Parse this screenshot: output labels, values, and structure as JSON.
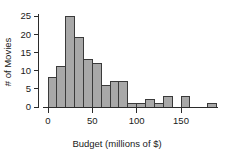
{
  "chart_data": {
    "type": "bar",
    "title": "",
    "subtitle": "",
    "xlabel": "Budget (millions of $)",
    "ylabel": "# of Movies",
    "xlim": [
      -5,
      195
    ],
    "ylim": [
      0,
      26
    ],
    "grid": false,
    "legend": null,
    "bin_width": 10,
    "bin_starts": [
      0,
      10,
      20,
      30,
      40,
      50,
      60,
      70,
      80,
      90,
      100,
      110,
      120,
      130,
      140,
      150,
      160,
      170,
      180
    ],
    "categories": [
      "0-10",
      "10-20",
      "20-30",
      "30-40",
      "40-50",
      "50-60",
      "60-70",
      "70-80",
      "80-90",
      "90-100",
      "100-110",
      "110-120",
      "120-130",
      "130-140",
      "140-150",
      "150-160",
      "160-170",
      "170-180",
      "180-190"
    ],
    "values": [
      8,
      11,
      25,
      19,
      13,
      12,
      6,
      7,
      7,
      1,
      1,
      2,
      1,
      3,
      0,
      3,
      0,
      0,
      1
    ],
    "xticks": [
      0,
      50,
      100,
      150
    ],
    "xtick_labels": [
      "0",
      "50",
      "100",
      "150"
    ],
    "yticks": [
      0,
      5,
      10,
      15,
      20,
      25
    ],
    "ytick_labels": [
      "0",
      "5",
      "10",
      "15",
      "20",
      "25"
    ],
    "bar_fill_color": "#a8a8a8",
    "bar_edge_color": "#3a3a3a",
    "axis_color": "#2b2b2b",
    "background_color": "#ffffff"
  }
}
